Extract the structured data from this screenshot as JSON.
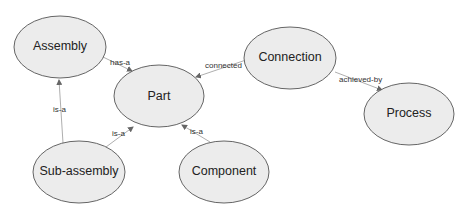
{
  "nodes": {
    "assembly": {
      "label": "Assembly"
    },
    "part": {
      "label": "Part"
    },
    "connection": {
      "label": "Connection"
    },
    "process": {
      "label": "Process"
    },
    "subassembly": {
      "label": "Sub-assembly"
    },
    "component": {
      "label": "Component"
    }
  },
  "edges": {
    "assembly_part": {
      "label": "has-a"
    },
    "connection_part": {
      "label": "connected"
    },
    "connection_process": {
      "label": "achieved-by"
    },
    "subassembly_assembly": {
      "label": "is-a"
    },
    "subassembly_part": {
      "label": "is-a"
    },
    "component_part": {
      "label": "is-a"
    }
  },
  "colors": {
    "node_fill": "#ececec",
    "node_stroke": "#555555",
    "edge": "#999999"
  }
}
